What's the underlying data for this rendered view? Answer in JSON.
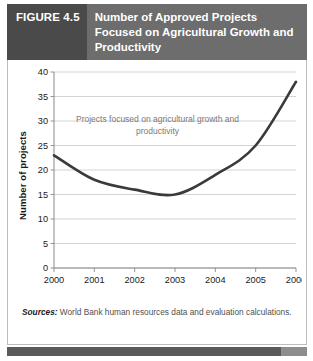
{
  "header": {
    "figure_label": "FIGURE 4.5",
    "title": "Number of Approved Projects Focused on Agricultural Growth and Productivity",
    "label_bg": "#4a4a4a",
    "title_bg": "#6d6d6d",
    "text_color": "#ffffff"
  },
  "source": {
    "label": "Sources:",
    "text": " World Bank human resources data and evaluation calculations."
  },
  "chart_data": {
    "type": "line",
    "title": "Number of Approved Projects Focused on Agricultural Growth and Productivity",
    "xlabel": "",
    "ylabel": "Number of projects",
    "categories": [
      "2000",
      "2001",
      "2002",
      "2003",
      "2004",
      "2005",
      "2006"
    ],
    "x": [
      2000,
      2001,
      2002,
      2003,
      2004,
      2005,
      2006
    ],
    "series": [
      {
        "name": "Projects focused on agricultural growth and productivity",
        "values": [
          23,
          18,
          16,
          15,
          19,
          25,
          38
        ]
      }
    ],
    "annotations": [
      {
        "text": "Projects focused on agricultural growth and productivity",
        "x": 2002.2,
        "y": 28,
        "color": "#7a7a7a"
      }
    ],
    "ylim": [
      0,
      40
    ],
    "y_ticks": [
      0,
      5,
      10,
      15,
      20,
      25,
      30,
      35,
      40
    ],
    "y_tick_labels": [
      "0",
      "5",
      "10",
      "15",
      "20",
      "25",
      "30",
      "35",
      "40"
    ],
    "x_tick_labels": [
      "2000",
      "2001",
      "2002",
      "2003",
      "2004",
      "2005",
      "2006"
    ],
    "grid": true,
    "grid_color": "#c8c8c8",
    "axis_color": "#8a8a8a",
    "line_color": "#3a3a3a",
    "line_width": 2.6,
    "legend": false,
    "legend_position": "none",
    "background": "#ffffff"
  }
}
